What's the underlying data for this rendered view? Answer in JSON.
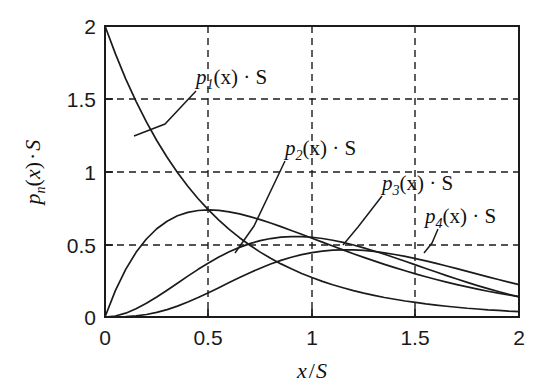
{
  "chart_data": {
    "type": "line",
    "title": "",
    "xlabel": "x/S",
    "ylabel": "p_n(x)·S",
    "xlim": [
      0,
      2
    ],
    "ylim": [
      0,
      2
    ],
    "grid": true,
    "legend_position": "inline-annotations",
    "xticks": [
      "0",
      "0.5",
      "1",
      "1.5",
      "2"
    ],
    "xtick_values": [
      0,
      0.5,
      1,
      1.5,
      2
    ],
    "yticks": [
      "0",
      "0.5",
      "1",
      "1.5",
      "2"
    ],
    "ytick_values": [
      0,
      0.5,
      1,
      1.5,
      2
    ],
    "x": [
      0,
      0.05,
      0.1,
      0.15,
      0.2,
      0.25,
      0.3,
      0.35,
      0.4,
      0.45,
      0.5,
      0.55,
      0.6,
      0.65,
      0.7,
      0.75,
      0.8,
      0.85,
      0.9,
      0.95,
      1,
      1.05,
      1.1,
      1.15,
      1.2,
      1.25,
      1.3,
      1.35,
      1.4,
      1.45,
      1.5,
      1.55,
      1.6,
      1.65,
      1.7,
      1.75,
      1.8,
      1.85,
      1.9,
      1.95,
      2
    ],
    "series": [
      {
        "name": "p_1(x)·S",
        "label": "p₁(x)·S",
        "n": 1,
        "peak_x": 0,
        "peak_y": 2,
        "end_y": 0.037,
        "values": [
          2,
          1.81,
          1.637,
          1.482,
          1.341,
          1.213,
          1.098,
          0.993,
          0.899,
          0.813,
          0.736,
          0.666,
          0.602,
          0.545,
          0.493,
          0.446,
          0.404,
          0.365,
          0.331,
          0.299,
          0.271,
          0.245,
          0.222,
          0.201,
          0.181,
          0.164,
          0.149,
          0.134,
          0.122,
          0.11,
          0.1,
          0.09,
          0.082,
          0.074,
          0.067,
          0.06,
          0.055,
          0.049,
          0.045,
          0.04,
          0.037
        ]
      },
      {
        "name": "p_2(x)·S",
        "label": "p₂(x)·S",
        "n": 2,
        "peak_x": 0.5,
        "peak_y": 0.736,
        "end_y": 0.147,
        "values": [
          0,
          0.362,
          0.655,
          0.889,
          1.072,
          1.213,
          1.317,
          1.391,
          1.438,
          1.464,
          1.472,
          1.465,
          1.446,
          1.417,
          1.38,
          1.338,
          1.292,
          1.242,
          1.19,
          1.137,
          1.083,
          1.029,
          0.975,
          0.922,
          0.87,
          0.82,
          0.771,
          0.724,
          0.678,
          0.635,
          0.593,
          0.553,
          0.515,
          0.479,
          0.445,
          0.413,
          0.383,
          0.354,
          0.327,
          0.302,
          0.279
        ]
      },
      {
        "name": "p_3(x)·S",
        "label": "p₃(x)·S",
        "n": 3,
        "peak_x": 1,
        "peak_y": 0.553,
        "end_y": 0.297,
        "values": [
          0,
          0.029,
          0.111,
          0.237,
          0.396,
          0.579,
          0.777,
          0.981,
          1.185,
          1.383,
          1.569,
          1.739,
          1.891,
          2.021,
          2.13,
          2.215,
          2.277,
          2.317,
          2.335,
          2.334,
          2.314,
          2.278,
          2.227,
          2.164,
          2.09,
          2.007,
          1.917,
          1.821,
          1.721,
          1.618,
          1.514,
          1.409,
          1.305,
          1.202,
          1.102,
          1.005,
          0.912,
          0.823,
          0.739,
          0.66,
          0.586
        ]
      },
      {
        "name": "p_4(x)·S",
        "label": "p₄(x)·S",
        "n": 4,
        "peak_x": 1.5,
        "peak_y": 0.462,
        "end_y": 0.408,
        "values": [
          0,
          0.002,
          0.018,
          0.057,
          0.127,
          0.232,
          0.372,
          0.546,
          0.749,
          0.975,
          1.218,
          1.471,
          1.726,
          1.978,
          2.22,
          2.447,
          2.654,
          2.838,
          2.997,
          3.128,
          3.231,
          3.305,
          3.351,
          3.37,
          3.365,
          3.336,
          3.287,
          3.219,
          3.135,
          3.038,
          2.929,
          2.811,
          2.686,
          2.556,
          2.422,
          2.286,
          2.15,
          2.014,
          1.88,
          1.749,
          1.621
        ]
      }
    ],
    "annotations": [
      {
        "label": "p₁(x)·S",
        "sub": "1",
        "at_x": 0.29,
        "at_y": 1.45
      },
      {
        "label": "p₂(x)·S",
        "sub": "2",
        "at_x": 0.57,
        "at_y": 0.73
      },
      {
        "label": "p₃(x)·S",
        "sub": "3",
        "at_x": 1.12,
        "at_y": 0.55
      },
      {
        "label": "p₄(x)·S",
        "sub": "4",
        "at_x": 1.52,
        "at_y": 0.51
      }
    ],
    "colors": {
      "curve": "#1b1b1b",
      "grid": "#1b1b1b",
      "frame": "#1b1b1b",
      "text": "#1a1a1a",
      "background": "#ffffff"
    }
  },
  "axis": {
    "x_title_var": "x",
    "x_title_slash": "/",
    "x_title_unit": "S",
    "y_title_p": "p",
    "y_title_sub": "n",
    "y_title_paren_open": "(",
    "y_title_var": "x",
    "y_title_paren_close": ")",
    "y_title_dot": "·",
    "y_title_unit": "S"
  },
  "labels": {
    "p1": {
      "p": "p",
      "sub": "1",
      "rest": "(x) · S"
    },
    "p2": {
      "p": "p",
      "sub": "2",
      "rest": "(x) · S"
    },
    "p3": {
      "p": "p",
      "sub": "3",
      "rest": "(x) · S"
    },
    "p4": {
      "p": "p",
      "sub": "4",
      "rest": "(x) · S"
    }
  }
}
